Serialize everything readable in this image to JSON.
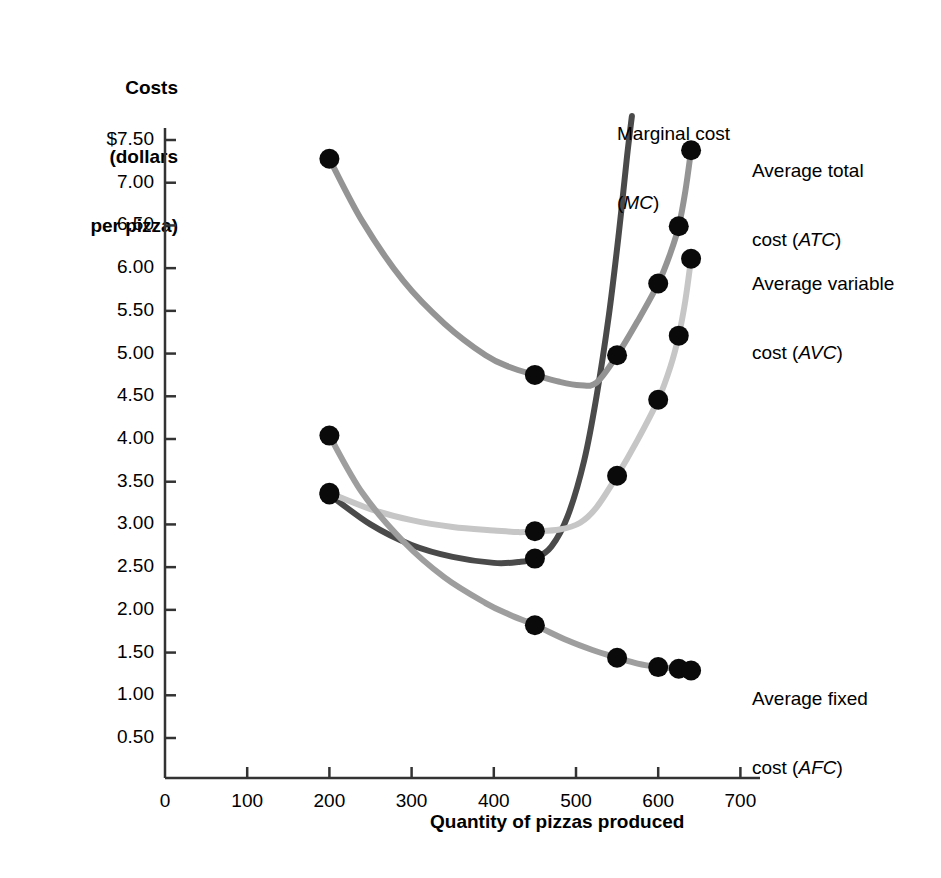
{
  "chart_data": {
    "type": "line",
    "title": "",
    "xlabel": "Quantity of pizzas produced",
    "ylabel": "Costs\n(dollars\nper pizza)",
    "xlim": [
      0,
      700
    ],
    "ylim": [
      0,
      7.75
    ],
    "grid": false,
    "legend_position": "inline-right",
    "x_ticks": [
      "0",
      "100",
      "200",
      "300",
      "400",
      "500",
      "600",
      "700"
    ],
    "y_ticks": [
      "$7.50",
      "7.00",
      "6.50",
      "6.00",
      "5.50",
      "5.00",
      "4.50",
      "4.00",
      "3.50",
      "3.00",
      "2.50",
      "2.00",
      "1.50",
      "1.00",
      "0.50"
    ],
    "series": [
      {
        "name": "Marginal cost",
        "abbr": "MC",
        "label_line1": "Marginal cost",
        "label_line2_open": "(",
        "label_line2_abbr": "MC",
        "label_line2_close": ")",
        "color": "#4a4a4a",
        "x": [
          200,
          450,
          500,
          540
        ],
        "values": [
          3.35,
          2.6,
          4.6,
          7.6
        ],
        "points_x": [
          200,
          450
        ],
        "points_y": [
          3.35,
          2.6
        ]
      },
      {
        "name": "Average total cost",
        "abbr": "ATC",
        "label_line1": "Average total",
        "label_line2_open": "cost (",
        "label_line2_abbr": "ATC",
        "label_line2_close": ")",
        "color": "#949494",
        "x": [
          200,
          450,
          550,
          600,
          625,
          640
        ],
        "values": [
          7.28,
          4.75,
          4.98,
          5.82,
          6.49,
          7.38
        ],
        "points_x": [
          200,
          450,
          550,
          600,
          625,
          640
        ],
        "points_y": [
          7.28,
          4.75,
          4.98,
          5.82,
          6.49,
          7.38
        ]
      },
      {
        "name": "Average variable cost",
        "abbr": "AVC",
        "label_line1": "Average variable",
        "label_line2_open": "cost (",
        "label_line2_abbr": "AVC",
        "label_line2_close": ")",
        "color": "#c6c6c6",
        "x": [
          200,
          450,
          550,
          600,
          625,
          640
        ],
        "values": [
          3.37,
          2.92,
          3.57,
          4.46,
          5.21,
          6.11
        ],
        "points_x": [
          200,
          450,
          550,
          600,
          625,
          640
        ],
        "points_y": [
          3.37,
          2.92,
          3.57,
          4.46,
          5.21,
          6.11
        ]
      },
      {
        "name": "Average fixed cost",
        "abbr": "AFC",
        "label_line1": "Average fixed",
        "label_line2_open": "cost (",
        "label_line2_abbr": "AFC",
        "label_line2_close": ")",
        "color": "#9e9e9e",
        "x": [
          200,
          450,
          550,
          600,
          625,
          640
        ],
        "values": [
          4.04,
          1.82,
          1.44,
          1.33,
          1.31,
          1.29
        ],
        "points_x": [
          200,
          450,
          550,
          600,
          625,
          640
        ],
        "points_y": [
          4.04,
          1.82,
          1.44,
          1.33,
          1.31,
          1.29
        ]
      }
    ]
  },
  "axes": {
    "y_title": "Costs\n(dollars\nper pizza)",
    "x_title": "Quantity of pizzas produced"
  },
  "labels": {
    "mc_line1": "Marginal cost",
    "mc_line2": "(MC)",
    "atc_line1": "Average total",
    "atc_line2": "cost (ATC)",
    "avc_line1": "Average variable",
    "avc_line2": "cost (AVC)",
    "afc_line1": "Average fixed",
    "afc_line2": "cost (AFC)"
  }
}
